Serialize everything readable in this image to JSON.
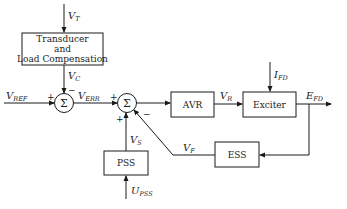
{
  "diagram": {
    "blocks": {
      "transducer": {
        "lines": [
          "Transducer",
          "and",
          "Load Compensation"
        ]
      },
      "avr": {
        "label": "AVR"
      },
      "exciter": {
        "label": "Exciter"
      },
      "pss": {
        "label": "PSS"
      },
      "ess": {
        "label": "ESS"
      }
    },
    "summing_junctions": {
      "sum1": {
        "symbol": "Σ",
        "signs": {
          "left": "+",
          "top": "−"
        }
      },
      "sum2": {
        "symbol": "Σ",
        "signs": {
          "left": "+",
          "bottom": "+",
          "lower_right": "−"
        }
      }
    },
    "signals": {
      "vt": {
        "main": "V",
        "sub": "T"
      },
      "vc": {
        "main": "V",
        "sub": "C"
      },
      "vref": {
        "main": "V",
        "sub": "REF"
      },
      "verr": {
        "main": "V",
        "sub": "ERR"
      },
      "vr": {
        "main": "V",
        "sub": "R"
      },
      "ifd": {
        "main": "I",
        "sub": "FD"
      },
      "efd": {
        "main": "E",
        "sub": "FD"
      },
      "vs": {
        "main": "V",
        "sub": "S"
      },
      "vf": {
        "main": "V",
        "sub": "F"
      },
      "upss": {
        "main": "U",
        "sub": "PSS"
      }
    }
  }
}
